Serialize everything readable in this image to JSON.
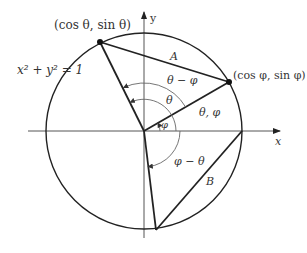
{
  "equation": "x² + y² = 1",
  "axes": {
    "x_label": "x",
    "y_label": "y"
  },
  "points": {
    "theta_point": "(cos θ, sin θ)",
    "phi_point": "(cos φ, sin φ)"
  },
  "chords": {
    "A": "A",
    "B": "B"
  },
  "angles": {
    "theta_minus_phi": "θ − φ",
    "theta": "θ",
    "theta_phi_label": "θ, φ",
    "phi": "φ",
    "phi_minus_theta": "φ − θ"
  },
  "colors": {
    "stroke": "#222222",
    "thin": "#666666",
    "background": "#ffffff"
  }
}
